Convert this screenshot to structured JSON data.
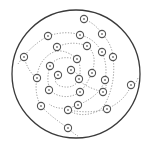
{
  "diagram": {
    "type": "spiral-node-diagram",
    "boundary": {
      "cx": 76,
      "cy": 74,
      "r": 64,
      "stroke": "#3a3a3a"
    },
    "node_style": {
      "r": 3.6,
      "stroke": "#555555",
      "fill": "#ffffff",
      "inner_dot": "#888888"
    },
    "path_style": {
      "stroke": "#8a8a8a",
      "dash": "1.2 1.6"
    },
    "nodes": [
      {
        "id": "n1",
        "x": 84,
        "y": 19
      },
      {
        "id": "n2",
        "x": 102,
        "y": 34
      },
      {
        "id": "n3",
        "x": 80,
        "y": 35
      },
      {
        "id": "n4",
        "x": 48,
        "y": 36
      },
      {
        "id": "n5",
        "x": 87,
        "y": 46
      },
      {
        "id": "n6",
        "x": 57,
        "y": 47
      },
      {
        "id": "n7",
        "x": 102,
        "y": 52
      },
      {
        "id": "n8",
        "x": 113,
        "y": 57
      },
      {
        "id": "n9",
        "x": 24,
        "y": 57
      },
      {
        "id": "n10",
        "x": 77,
        "y": 59
      },
      {
        "id": "n11",
        "x": 50,
        "y": 66
      },
      {
        "id": "n12",
        "x": 71,
        "y": 70
      },
      {
        "id": "n13",
        "x": 92,
        "y": 73
      },
      {
        "id": "n14",
        "x": 58,
        "y": 75
      },
      {
        "id": "n15",
        "x": 79,
        "y": 79
      },
      {
        "id": "n16",
        "x": 37,
        "y": 78
      },
      {
        "id": "n17",
        "x": 105,
        "y": 80
      },
      {
        "id": "n18",
        "x": 131,
        "y": 85
      },
      {
        "id": "n19",
        "x": 49,
        "y": 90
      },
      {
        "id": "n20",
        "x": 80,
        "y": 92
      },
      {
        "id": "n21",
        "x": 103,
        "y": 92
      },
      {
        "id": "n22",
        "x": 41,
        "y": 106
      },
      {
        "id": "n23",
        "x": 78,
        "y": 105
      },
      {
        "id": "n24",
        "x": 68,
        "y": 110
      },
      {
        "id": "n25",
        "x": 107,
        "y": 109
      },
      {
        "id": "n26",
        "x": 68,
        "y": 128
      }
    ],
    "paths": [
      {
        "id": "arm-outer-top",
        "d": "M18 64 Q30 46 48 36 Q66 30 80 35 Q94 38 102 52 Q108 66 105 80 Q100 96 78 105 Q60 112 49 104"
      },
      {
        "id": "arm-top-right",
        "d": "M84 19 Q96 24 102 34 Q112 44 113 57 Q116 80 107 100 Q104 108 96 112 Q80 118 68 110"
      },
      {
        "id": "arm-inner-1",
        "d": "M57 47 Q72 40 87 46 Q98 54 92 73 Q86 86 80 92 Q68 100 55 94 Q44 86 50 66 Q56 56 71 58"
      },
      {
        "id": "arm-inner-2",
        "d": "M37 78 Q38 62 50 54 Q62 46 77 59 Q82 66 79 79 Q74 90 60 86 Q52 82 58 75"
      },
      {
        "id": "arm-left-down",
        "d": "M24 57 Q28 72 37 78 Q34 94 41 106 Q50 116 68 128 Q74 134 78 136"
      },
      {
        "id": "arm-right-down",
        "d": "M138 78 Q134 88 131 85 Q126 100 107 109 Q90 114 68 110"
      },
      {
        "id": "arm-inner-3",
        "d": "M71 70 Q78 72 79 79 Q82 86 103 92 Q108 88 105 80"
      }
    ]
  }
}
